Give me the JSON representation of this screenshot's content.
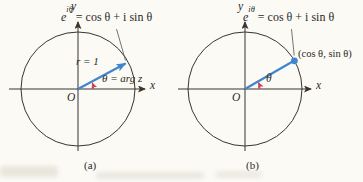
{
  "page": {
    "background": "#fcfaf5",
    "ink_color": "#38352f",
    "text_color": "#2c2a26",
    "ray_blue": "#3f86cc",
    "angle_red": "#cc4257"
  },
  "diagram_a": {
    "caption": "(a)",
    "axis_y_label": "y",
    "axis_x_label": "x",
    "origin_label": "O",
    "radius_label": "r = 1",
    "angle_label": "θ = arg z",
    "formula": {
      "base": "e",
      "exponent": "iθ",
      "rest": "= cos θ + i sin θ"
    }
  },
  "diagram_b": {
    "caption": "(b)",
    "axis_y_label": "y",
    "axis_x_label": "x",
    "origin_label": "O",
    "angle_label": "θ",
    "point_label": "(cos θ, sin θ)",
    "formula": {
      "base": "e",
      "exponent": "iθ",
      "rest": "= cos θ + i sin θ"
    }
  }
}
